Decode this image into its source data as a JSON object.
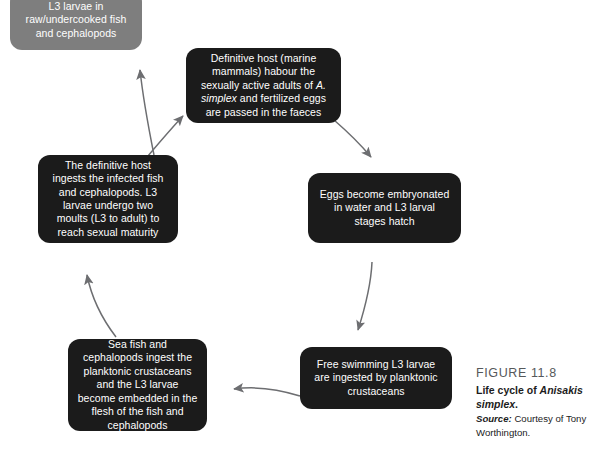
{
  "figure": {
    "number_label": "FIGURE 11.8",
    "title_prefix": "Life cycle of ",
    "title_species": "Anisakis simplex",
    "title_suffix": ".",
    "source_label": "Source:",
    "source_text": " Courtesy of Tony Worthington."
  },
  "diagram": {
    "type": "cycle-flow",
    "colors": {
      "dark_node": "#1b1b1b",
      "grey_node": "#7e7e7e",
      "node_text": "#ffffff",
      "arrow": "#6d6e71",
      "background": "#ffffff",
      "caption_heading": "#55585a",
      "caption_body": "#1c1c1c"
    },
    "nodes": [
      {
        "id": "human-consumption",
        "style": "grey",
        "text": "L3 larvae in raw/undercooked fish and cephalopods"
      },
      {
        "id": "definitive-host",
        "style": "dark",
        "text_parts": [
          "Definitive host (marine mammals) habour the sexually active adults of ",
          "A. simplex",
          " and fertilized eggs are passed in the faeces"
        ],
        "text": "Definitive host (marine mammals) habour the sexually active adults of A. simplex and fertilized eggs are passed in the faeces"
      },
      {
        "id": "eggs-embryonated",
        "style": "dark",
        "text": "Eggs become embryonated in water and L3 larval stages hatch"
      },
      {
        "id": "free-swimming-larvae",
        "style": "dark",
        "text": "Free swimming L3 larvae are ingested by planktonic crustaceans"
      },
      {
        "id": "sea-fish-cephalopods",
        "style": "dark",
        "text": "Sea fish and cephalopods ingest the planktonic crustaceans and the L3 larvae become embedded in the flesh of the fish and cephalopods"
      },
      {
        "id": "host-ingests-fish",
        "style": "dark",
        "text": "The definitive host ingests the infected fish and cephalopods. L3 larvae undergo two moults (L3 to adult) to reach sexual maturity"
      }
    ],
    "edges": [
      {
        "from": "definitive-host",
        "to": "eggs-embryonated"
      },
      {
        "from": "eggs-embryonated",
        "to": "free-swimming-larvae"
      },
      {
        "from": "free-swimming-larvae",
        "to": "sea-fish-cephalopods"
      },
      {
        "from": "sea-fish-cephalopods",
        "to": "host-ingests-fish"
      },
      {
        "from": "host-ingests-fish",
        "to": "human-consumption"
      },
      {
        "from": "sea-fish-cephalopods",
        "to": "definitive-host"
      }
    ]
  }
}
